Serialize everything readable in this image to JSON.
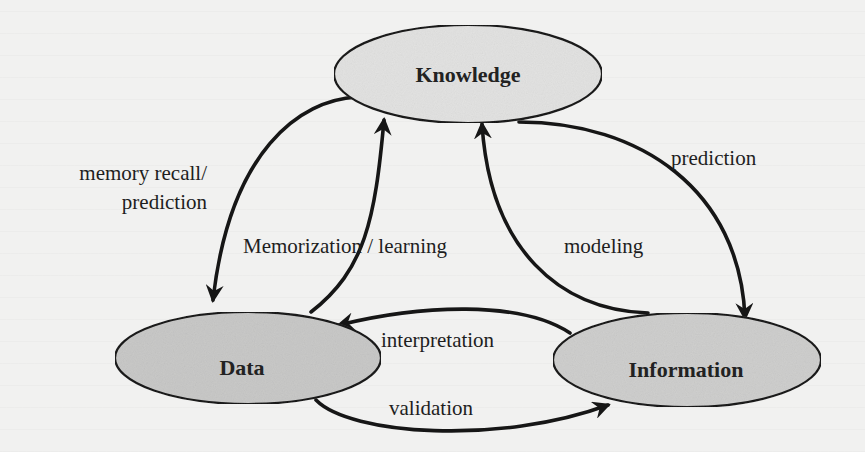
{
  "diagram": {
    "type": "cycle-flow",
    "nodes": [
      {
        "id": "knowledge",
        "label": "Knowledge",
        "fill": "#e3e3e2"
      },
      {
        "id": "data",
        "label": "Data",
        "fill": "#c9c9c8"
      },
      {
        "id": "information",
        "label": "Information",
        "fill": "#cfcfce"
      }
    ],
    "edges": [
      {
        "id": "memory-recall",
        "from": "knowledge",
        "to": "data",
        "label_line1": "memory recall/",
        "label_line2": "prediction"
      },
      {
        "id": "memorization",
        "from": "data",
        "to": "knowledge",
        "label": "Memorization / learning"
      },
      {
        "id": "modeling",
        "from": "information",
        "to": "knowledge",
        "label": "modeling"
      },
      {
        "id": "prediction",
        "from": "knowledge",
        "to": "information",
        "label": "prediction"
      },
      {
        "id": "interpretation",
        "from": "information",
        "to": "data",
        "label": "interpretation"
      },
      {
        "id": "validation",
        "from": "data",
        "to": "information",
        "label": "validation"
      }
    ],
    "colors": {
      "stroke": "#161616",
      "background": "#f1f1f0"
    }
  }
}
